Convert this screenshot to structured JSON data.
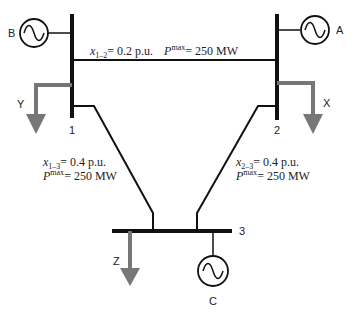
{
  "diagram": {
    "type": "three-bus power system",
    "buses": [
      {
        "id": "1",
        "label": "1"
      },
      {
        "id": "2",
        "label": "2"
      },
      {
        "id": "3",
        "label": "3"
      }
    ],
    "generators": [
      {
        "label": "A",
        "bus": "2"
      },
      {
        "label": "B",
        "bus": "1"
      },
      {
        "label": "C",
        "bus": "3"
      }
    ],
    "loads": [
      {
        "label": "X",
        "bus": "2"
      },
      {
        "label": "Y",
        "bus": "1"
      },
      {
        "label": "Z",
        "bus": "3"
      }
    ],
    "lines": [
      {
        "from": "1",
        "to": "2",
        "x_var": "x",
        "x_sub": "1–2",
        "x_value": "= 0.2 p.u.",
        "p_var": "P",
        "p_sup": "max",
        "p_value": "= 250 MW"
      },
      {
        "from": "1",
        "to": "3",
        "x_var": "x",
        "x_sub": "1–3",
        "x_value": "= 0.4 p.u.",
        "p_var": "P",
        "p_sup": "max",
        "p_value": "= 250 MW"
      },
      {
        "from": "2",
        "to": "3",
        "x_var": "x",
        "x_sub": "2–3",
        "x_value": "= 0.4 p.u.",
        "p_var": "P",
        "p_sup": "max",
        "p_value": "= 250 MW"
      }
    ]
  }
}
